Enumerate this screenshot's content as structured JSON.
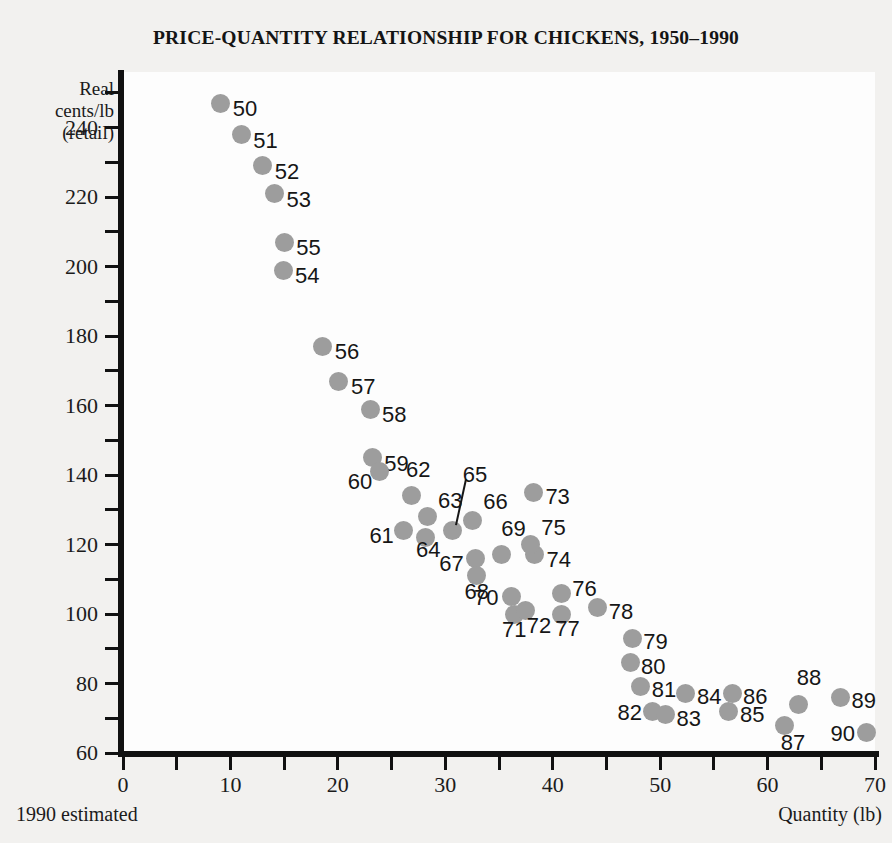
{
  "chart_data": {
    "type": "scatter",
    "title": "PRICE-QUANTITY RELATIONSHIP FOR CHICKENS, 1950–1990",
    "xlabel": "Quantity (lb)",
    "ylabel": "Real cents/lb (retail)",
    "ylabel_lines": [
      "Real",
      "cents/lb",
      "(retail)"
    ],
    "footnote": "1990 estimated",
    "xlim": [
      0,
      70
    ],
    "ylim": [
      60,
      256
    ],
    "grid": false,
    "legend": "none",
    "xticks": [
      0,
      10,
      20,
      30,
      40,
      50,
      60,
      70
    ],
    "xtick_labels": [
      "0",
      "10",
      "20",
      "30",
      "40",
      "50",
      "60",
      "70"
    ],
    "xminor_step": 5,
    "yticks": [
      60,
      80,
      100,
      120,
      140,
      160,
      180,
      200,
      220,
      240
    ],
    "ytick_labels": [
      "60",
      "80",
      "100",
      "120",
      "140",
      "160",
      "180",
      "200",
      "220",
      "240"
    ],
    "yminor_step": 10,
    "point_color": "#9d9d9d",
    "axis_color": "#111111",
    "background": "#fdfdfd",
    "page_background": "#f2f1ef",
    "points": [
      {
        "label": "50",
        "x": 9.1,
        "y": 247,
        "lx": 12,
        "ly": 6
      },
      {
        "label": "51",
        "x": 11.0,
        "y": 238,
        "lx": 12,
        "ly": 6
      },
      {
        "label": "52",
        "x": 13.0,
        "y": 229,
        "lx": 12,
        "ly": 6
      },
      {
        "label": "53",
        "x": 14.1,
        "y": 221,
        "lx": 12,
        "ly": 6
      },
      {
        "label": "54",
        "x": 14.9,
        "y": 199,
        "lx": 12,
        "ly": 6
      },
      {
        "label": "55",
        "x": 15.0,
        "y": 207,
        "lx": 12,
        "ly": 6
      },
      {
        "label": "56",
        "x": 18.6,
        "y": 177,
        "lx": 12,
        "ly": 6
      },
      {
        "label": "57",
        "x": 20.1,
        "y": 167,
        "lx": 12,
        "ly": 6
      },
      {
        "label": "58",
        "x": 23.0,
        "y": 159,
        "lx": 12,
        "ly": 6
      },
      {
        "label": "59",
        "x": 23.2,
        "y": 145,
        "lx": 12,
        "ly": 6
      },
      {
        "label": "60",
        "x": 23.9,
        "y": 141,
        "lx": -32,
        "ly": 10
      },
      {
        "label": "61",
        "x": 26.1,
        "y": 124,
        "lx": -34,
        "ly": 5
      },
      {
        "label": "62",
        "x": 26.9,
        "y": 134,
        "lx": -6,
        "ly": -26
      },
      {
        "label": "63",
        "x": 28.3,
        "y": 128,
        "lx": 11,
        "ly": -16
      },
      {
        "label": "64",
        "x": 28.2,
        "y": 122,
        "lx": -10,
        "ly": 12
      },
      {
        "label": "65",
        "x": 30.7,
        "y": 124,
        "lx": 10,
        "ly": -56,
        "leader": true
      },
      {
        "label": "66",
        "x": 32.5,
        "y": 127,
        "lx": 11,
        "ly": -18
      },
      {
        "label": "67",
        "x": 32.8,
        "y": 116,
        "lx": -36,
        "ly": 6
      },
      {
        "label": "68",
        "x": 32.9,
        "y": 111,
        "lx": -12,
        "ly": 16
      },
      {
        "label": "69",
        "x": 35.2,
        "y": 117,
        "lx": 0,
        "ly": -26
      },
      {
        "label": "70",
        "x": 36.2,
        "y": 105,
        "lx": -38,
        "ly": 1
      },
      {
        "label": "71",
        "x": 36.4,
        "y": 100,
        "lx": -12,
        "ly": 16
      },
      {
        "label": "72",
        "x": 37.5,
        "y": 101,
        "lx": 1,
        "ly": 15
      },
      {
        "label": "73",
        "x": 38.2,
        "y": 135,
        "lx": 12,
        "ly": 5
      },
      {
        "label": "74",
        "x": 38.3,
        "y": 117,
        "lx": 12,
        "ly": 5
      },
      {
        "label": "75",
        "x": 37.9,
        "y": 120,
        "lx": 11,
        "ly": -17
      },
      {
        "label": "76",
        "x": 40.8,
        "y": 106,
        "lx": 11,
        "ly": -4
      },
      {
        "label": "77",
        "x": 40.8,
        "y": 100,
        "lx": -6,
        "ly": 15
      },
      {
        "label": "78",
        "x": 44.2,
        "y": 102,
        "lx": 11,
        "ly": 5
      },
      {
        "label": "79",
        "x": 47.4,
        "y": 93,
        "lx": 11,
        "ly": 4
      },
      {
        "label": "80",
        "x": 47.2,
        "y": 86,
        "lx": 11,
        "ly": 4
      },
      {
        "label": "81",
        "x": 48.2,
        "y": 79,
        "lx": 11,
        "ly": 3
      },
      {
        "label": "82",
        "x": 49.3,
        "y": 72,
        "lx": -35,
        "ly": 2
      },
      {
        "label": "83",
        "x": 50.5,
        "y": 71,
        "lx": 11,
        "ly": 4
      },
      {
        "label": "84",
        "x": 52.4,
        "y": 77,
        "lx": 11,
        "ly": 3
      },
      {
        "label": "85",
        "x": 56.4,
        "y": 72,
        "lx": 11,
        "ly": 4
      },
      {
        "label": "86",
        "x": 56.7,
        "y": 77,
        "lx": 11,
        "ly": 3
      },
      {
        "label": "87",
        "x": 61.6,
        "y": 68,
        "lx": -4,
        "ly": 18
      },
      {
        "label": "88",
        "x": 62.9,
        "y": 74,
        "lx": -2,
        "ly": -26
      },
      {
        "label": "89",
        "x": 66.8,
        "y": 76,
        "lx": 11,
        "ly": 4
      },
      {
        "label": "90",
        "x": 69.2,
        "y": 66,
        "lx": -36,
        "ly": 2
      }
    ]
  }
}
